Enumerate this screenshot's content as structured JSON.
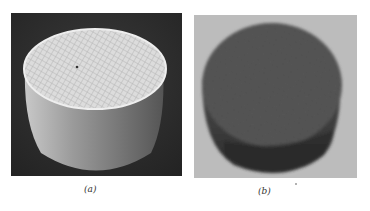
{
  "figure": {
    "panels": [
      {
        "id": "a",
        "caption": "(a)",
        "description": "white cylindrical honeycomb monolith on dark background",
        "colors": {
          "background": "#2b2b2b",
          "object": "#d8d8d8"
        }
      },
      {
        "id": "b",
        "caption": "(b)",
        "description": "dark cylindrical honeycomb monolith on light background",
        "colors": {
          "background": "#b9b9b9",
          "object": "#4a4a4a"
        }
      }
    ]
  }
}
